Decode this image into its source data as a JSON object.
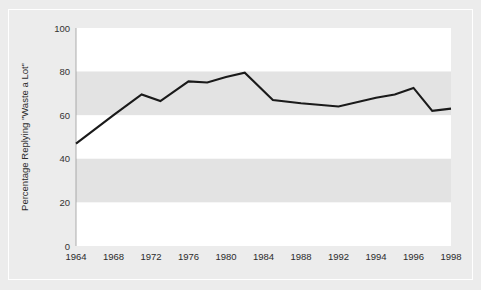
{
  "figure": {
    "top_caption": "",
    "background_color": "#ececec",
    "band_color_light": "#ffffff",
    "band_color_shaded": "#e2e2e2",
    "line_color": "#1a1a1a"
  },
  "chart_data": {
    "type": "line",
    "title": "",
    "xlabel": "",
    "ylabel": "Percentage Replying \"Waste a Lot\"",
    "xlim": [
      1964,
      1998
    ],
    "ylim": [
      0,
      100
    ],
    "grid": false,
    "legend_position": "none",
    "y_ticks": [
      0,
      20,
      40,
      60,
      80,
      100
    ],
    "y_tick_labels": [
      "0",
      "20",
      "40",
      "60",
      "80",
      "100"
    ],
    "x_ticks": [
      1964,
      1968,
      1972,
      1976,
      1980,
      1984,
      1988,
      1992,
      1994,
      1996,
      1998
    ],
    "x_tick_labels": [
      "1964",
      "1968",
      "1972",
      "1976",
      "1980",
      "1984",
      "1988",
      "1992",
      "1994",
      "1996",
      "1998"
    ],
    "banded_background": true,
    "bands": [
      {
        "from": 0,
        "to": 20,
        "shade": "light"
      },
      {
        "from": 20,
        "to": 40,
        "shade": "shaded"
      },
      {
        "from": 40,
        "to": 60,
        "shade": "light"
      },
      {
        "from": 60,
        "to": 80,
        "shade": "shaded"
      },
      {
        "from": 80,
        "to": 100,
        "shade": "light"
      }
    ],
    "series": [
      {
        "name": "Percentage Replying \"Waste a Lot\"",
        "x": [
          1964,
          1968,
          1971,
          1973,
          1976,
          1978,
          1980,
          1982,
          1985,
          1988,
          1992,
          1994,
          1995,
          1996,
          1997,
          1998
        ],
        "values": [
          47,
          60,
          69.5,
          66.5,
          75.5,
          75,
          77.5,
          79.5,
          67,
          65.5,
          64,
          68,
          69.5,
          72.5,
          62,
          63
        ]
      }
    ]
  }
}
